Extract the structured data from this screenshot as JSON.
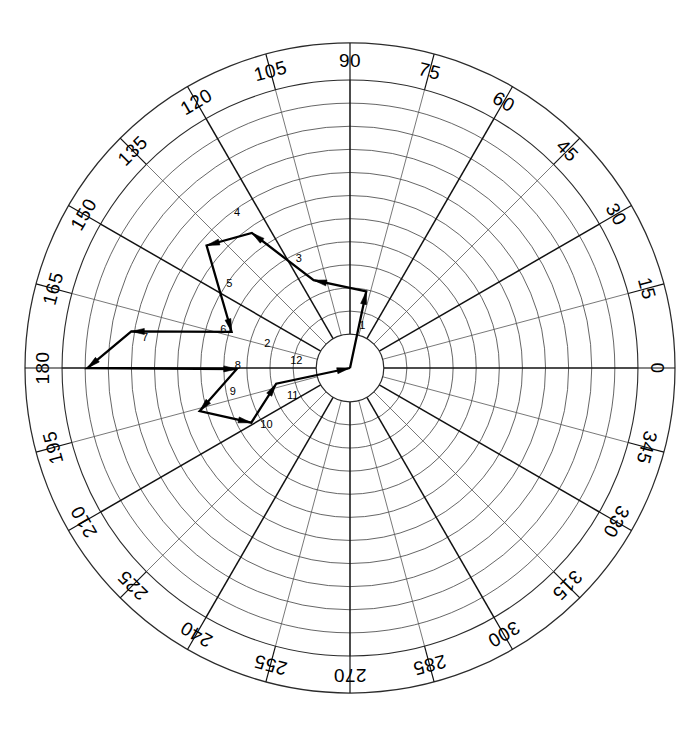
{
  "figure": {
    "title": "",
    "background_color": "#ffffff",
    "line_color": "#000000",
    "grid_color": "#4a4a4a",
    "spoke_color": "#111111"
  },
  "chart_data": {
    "type": "line",
    "subtype": "polar-traverse",
    "title": "",
    "xlabel": "",
    "ylabel": "",
    "grid": true,
    "legend_position": "none",
    "angular_axis": {
      "unit": "degrees",
      "start": 0,
      "step": 15,
      "direction": "counterclockwise",
      "zero_at": "east",
      "tick_labels": [
        "0",
        "15",
        "30",
        "45",
        "60",
        "75",
        "90",
        "105",
        "120",
        "135",
        "150",
        "165",
        "180",
        "195",
        "210",
        "225",
        "240",
        "255",
        "270",
        "285",
        "300",
        "315",
        "330",
        "345"
      ],
      "tick_values": [
        0,
        15,
        30,
        45,
        60,
        75,
        90,
        105,
        120,
        135,
        150,
        165,
        180,
        195,
        210,
        225,
        240,
        255,
        270,
        285,
        300,
        315,
        330,
        345
      ],
      "major_every": 30
    },
    "radial_axis": {
      "rings": 11,
      "hub_radius_fraction": 0.104,
      "outer_ring_fraction": 1.0,
      "label_band_inner_fraction": 0.886,
      "tick_labels": []
    },
    "segments": [
      {
        "label": "1",
        "angle_deg": 78.0,
        "radius_frac": 0.272,
        "label_angle_deg": 74.0,
        "label_radius_frac": 0.155
      },
      {
        "label": "2",
        "angle_deg": 178.0,
        "radius_frac": 0.384,
        "label_angle_deg": 163.0,
        "label_radius_frac": 0.3
      },
      {
        "label": "3",
        "angle_deg": 108.0,
        "radius_frac": 0.596,
        "label_angle_deg": 115.0,
        "label_radius_frac": 0.42
      },
      {
        "label": "4",
        "angle_deg": 159.0,
        "radius_frac": 0.672,
        "label_angle_deg": 126.0,
        "label_radius_frac": 0.668
      },
      {
        "label": "5",
        "angle_deg": 190.5,
        "radius_frac": 0.535,
        "label_angle_deg": 145.0,
        "label_radius_frac": 0.512
      },
      {
        "label": "6",
        "angle_deg": 183.0,
        "radius_frac": 0.745,
        "label_angle_deg": 163.0,
        "label_radius_frac": 0.46
      },
      {
        "label": "7",
        "angle_deg": 240.0,
        "radius_frac": 0.827,
        "label_angle_deg": 171.5,
        "label_radius_frac": 0.72
      },
      {
        "label": "8",
        "angle_deg": 2.0,
        "radius_frac": 0.53,
        "label_angle_deg": 178.5,
        "label_radius_frac": 0.39
      },
      {
        "label": "9",
        "angle_deg": 252.0,
        "radius_frac": 0.48,
        "label_angle_deg": 191.0,
        "label_radius_frac": 0.415
      },
      {
        "label": "10",
        "angle_deg": 328.0,
        "radius_frac": 0.61,
        "label_angle_deg": 214.0,
        "label_radius_frac": 0.35
      },
      {
        "label": "11",
        "angle_deg": 90.5,
        "radius_frac": 0.56,
        "label_angle_deg": 205.0,
        "label_radius_frac": 0.22
      },
      {
        "label": "12",
        "angle_deg": 186.0,
        "radius_frac": 0.312,
        "label_angle_deg": 172.0,
        "label_radius_frac": 0.188
      }
    ],
    "vertices_polar": [
      {
        "angle_deg": 0.0,
        "radius_frac": 0.0
      },
      {
        "angle_deg": 78.0,
        "radius_frac": 0.272
      },
      {
        "angle_deg": 112.5,
        "radius_frac": 0.33
      },
      {
        "angle_deg": 126.0,
        "radius_frac": 0.58
      },
      {
        "angle_deg": 139.5,
        "radius_frac": 0.655
      },
      {
        "angle_deg": 163.0,
        "radius_frac": 0.43
      },
      {
        "angle_deg": 170.5,
        "radius_frac": 0.77
      },
      {
        "angle_deg": 180.0,
        "radius_frac": 0.912
      },
      {
        "angle_deg": 180.5,
        "radius_frac": 0.393
      },
      {
        "angle_deg": 196.0,
        "radius_frac": 0.543
      },
      {
        "angle_deg": 209.0,
        "radius_frac": 0.392
      },
      {
        "angle_deg": 192.0,
        "radius_frac": 0.262
      },
      {
        "angle_deg": 0.0,
        "radius_frac": 0.0
      }
    ]
  }
}
